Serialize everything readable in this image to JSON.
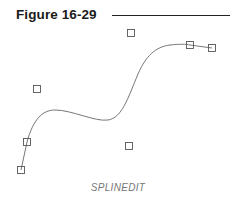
{
  "figure": {
    "title": "Figure 16-29",
    "caption": "SPLINEDIT"
  },
  "diagram": {
    "curve_color": "#777777",
    "grip_color": "#555555",
    "control_points": [
      {
        "x": 21,
        "y": 170,
        "on_curve": true
      },
      {
        "x": 27,
        "y": 142,
        "on_curve": true
      },
      {
        "x": 37,
        "y": 89,
        "on_curve": false
      },
      {
        "x": 129,
        "y": 146,
        "on_curve": false
      },
      {
        "x": 131,
        "y": 33,
        "on_curve": false
      },
      {
        "x": 190,
        "y": 45,
        "on_curve": true
      },
      {
        "x": 212,
        "y": 48,
        "on_curve": true
      }
    ]
  }
}
